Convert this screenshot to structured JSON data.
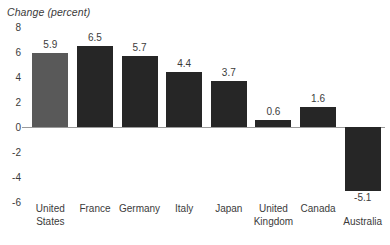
{
  "chart_data": {
    "type": "bar",
    "title": "",
    "ylabel": "Change (percent)",
    "xlabel": "",
    "categories": [
      "United States",
      "France",
      "Germany",
      "Italy",
      "Japan",
      "United Kingdom",
      "Canada",
      "Australia"
    ],
    "values": [
      5.9,
      6.5,
      5.7,
      4.4,
      3.7,
      0.6,
      1.6,
      -5.1
    ],
    "value_labels": [
      "5.9",
      "6.5",
      "5.7",
      "4.4",
      "3.7",
      "0.6",
      "1.6",
      "-5.1"
    ],
    "ylim": [
      -6,
      8
    ],
    "yticks": [
      8,
      6,
      4,
      2,
      0,
      -2,
      -4,
      -6
    ],
    "ytick_labels": [
      "8",
      "6",
      "4",
      "2",
      "0",
      "-2",
      "-4",
      "-6"
    ],
    "grid": false,
    "legend": false,
    "bar_color": "#262626",
    "highlight_color": "#595959",
    "highlight_index": 0,
    "axis_line_color": "#9a9a9a",
    "background": "#ffffff",
    "text_color": "#3b3b3b"
  }
}
